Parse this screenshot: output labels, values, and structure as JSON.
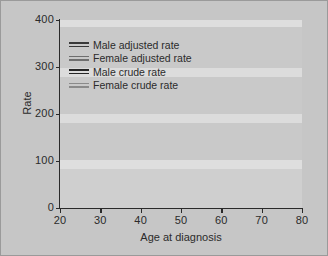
{
  "chart_data": {
    "type": "line",
    "title": "",
    "xlabel": "Age at diagnosis",
    "ylabel": "Rate",
    "xlim": [
      20,
      80
    ],
    "ylim": [
      0,
      400
    ],
    "xticks": [
      20,
      30,
      40,
      50,
      60,
      70,
      80
    ],
    "yticks": [
      0,
      100,
      200,
      300,
      400
    ],
    "grid": "horizontal light bands at 100,200,300,400",
    "legend_position": "upper-left inside axes",
    "x": [
      20,
      25,
      30,
      35,
      40,
      45,
      50,
      55,
      60,
      65,
      70,
      75,
      80
    ],
    "series": [
      {
        "name": "Male adjusted rate",
        "color": "#3a3a3a",
        "values": [
          22,
          24,
          26,
          29,
          33,
          40,
          52,
          68,
          92,
          128,
          180,
          248,
          345
        ]
      },
      {
        "name": "Female adjusted rate",
        "color": "#6f6f6f",
        "values": [
          12,
          15,
          18,
          22,
          27,
          33,
          40,
          48,
          57,
          68,
          80,
          94,
          110
        ]
      },
      {
        "name": "Male crude rate",
        "color": "#262626",
        "values": [
          21,
          22,
          23,
          24,
          26,
          28,
          31,
          36,
          43,
          49,
          54,
          57,
          60
        ]
      },
      {
        "name": "Female crude rate",
        "color": "#8a8a8a",
        "values": [
          11,
          13,
          15,
          17,
          19,
          21,
          23,
          25,
          27,
          29,
          31,
          33,
          35
        ]
      }
    ]
  },
  "axes": {
    "y_title": "Rate",
    "x_title": "Age at diagnosis",
    "y_tick_labels": [
      "0",
      "100",
      "200",
      "300",
      "400"
    ],
    "x_tick_labels": [
      "20",
      "30",
      "40",
      "50",
      "60",
      "70",
      "80"
    ]
  },
  "legend": {
    "items": [
      {
        "label": "Male adjusted rate"
      },
      {
        "label": "Female adjusted rate"
      },
      {
        "label": "Male crude rate"
      },
      {
        "label": "Female crude rate"
      }
    ]
  },
  "style": {
    "figure_background": "#c6c6c6",
    "band_light": "#d8d8d8",
    "band_lighter": "#e2e2e2",
    "axis_color": "#2a2a2a",
    "text_color": "#2b2b2b",
    "border_color": "#9a9a9a"
  }
}
